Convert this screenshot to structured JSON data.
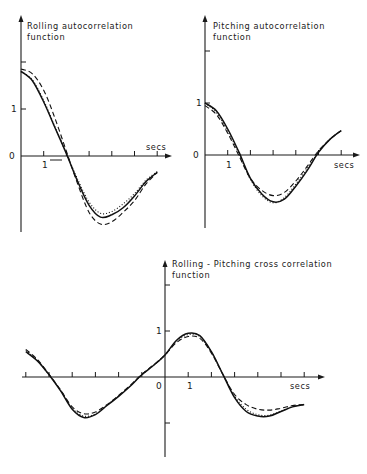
{
  "chart_data": [
    {
      "id": "rolling",
      "type": "line",
      "title": "Rolling autocorrelation function",
      "title_lines": [
        "Rolling  autocorrelation",
        "function"
      ],
      "xlabel": "secs",
      "ylabel": "",
      "x_tick_labels": [
        {
          "x": 1,
          "label": "1"
        }
      ],
      "y_tick_labels": [
        {
          "y": 0,
          "label": "0"
        },
        {
          "y": 1,
          "label": "1"
        }
      ],
      "x_ticks": [
        1,
        2,
        3,
        4,
        5,
        6
      ],
      "y_ticks": [
        1,
        2
      ],
      "xlim": [
        0,
        6.6
      ],
      "ylim": [
        -2.1,
        3.0
      ],
      "grid": false,
      "legend": null,
      "series": [
        {
          "name": "solid",
          "style": "solid",
          "x": [
            0,
            0.5,
            1.0,
            1.5,
            2.0,
            2.5,
            3.0,
            3.5,
            4.0,
            4.5,
            5.0,
            5.5,
            6.0
          ],
          "y": [
            1.8,
            1.6,
            1.15,
            0.6,
            0.05,
            -0.55,
            -1.05,
            -1.3,
            -1.25,
            -1.1,
            -0.85,
            -0.55,
            -0.35
          ]
        },
        {
          "name": "dashed",
          "style": "dashed",
          "x": [
            0,
            0.5,
            1.0,
            1.5,
            2.0,
            2.5,
            3.0,
            3.5,
            4.0,
            4.5,
            5.0,
            5.5,
            6.0
          ],
          "y": [
            1.85,
            1.75,
            1.4,
            0.8,
            0.1,
            -0.6,
            -1.2,
            -1.45,
            -1.4,
            -1.2,
            -0.95,
            -0.6,
            -0.35
          ]
        },
        {
          "name": "dotted",
          "style": "dotted",
          "x": [
            0,
            0.5,
            1.0,
            1.5,
            2.0,
            2.5,
            3.0,
            3.5,
            4.0,
            4.5,
            5.0,
            5.5,
            6.0
          ],
          "y": [
            1.8,
            1.62,
            1.18,
            0.62,
            0.05,
            -0.5,
            -0.98,
            -1.22,
            -1.18,
            -1.02,
            -0.8,
            -0.52,
            -0.33
          ]
        }
      ]
    },
    {
      "id": "pitching",
      "type": "line",
      "title": "Pitching autocorrelation function",
      "title_lines": [
        "Pitching  autocorrelation",
        "function"
      ],
      "xlabel": "secs",
      "ylabel": "",
      "x_tick_labels": [
        {
          "x": 1,
          "label": "1"
        }
      ],
      "y_tick_labels": [
        {
          "y": 0,
          "label": "0"
        },
        {
          "y": 1,
          "label": "1"
        }
      ],
      "x_ticks": [
        1,
        2,
        3,
        4,
        5,
        6
      ],
      "y_ticks": [
        1,
        2
      ],
      "xlim": [
        0,
        6.8
      ],
      "ylim": [
        -1.4,
        3.0
      ],
      "grid": false,
      "legend": null,
      "series": [
        {
          "name": "solid",
          "style": "solid",
          "x": [
            0,
            0.5,
            1.0,
            1.5,
            2.0,
            2.5,
            3.0,
            3.5,
            4.0,
            4.5,
            5.0,
            5.5,
            6.0
          ],
          "y": [
            1.0,
            0.85,
            0.5,
            0.05,
            -0.45,
            -0.75,
            -0.9,
            -0.85,
            -0.6,
            -0.3,
            0.05,
            0.3,
            0.47
          ]
        },
        {
          "name": "dashed",
          "style": "dashed",
          "x": [
            0,
            0.5,
            1.0,
            1.5,
            2.0,
            2.5,
            3.0,
            3.5,
            4.0,
            4.5,
            5.0,
            5.5,
            6.0
          ],
          "y": [
            0.95,
            0.78,
            0.42,
            -0.02,
            -0.45,
            -0.68,
            -0.78,
            -0.72,
            -0.5,
            -0.22,
            0.08,
            0.3,
            0.47
          ]
        },
        {
          "name": "dotted",
          "style": "dotted",
          "x": [
            0,
            0.5,
            1.0,
            1.5,
            2.0,
            2.5,
            3.0,
            3.5,
            4.0,
            4.5,
            5.0,
            5.5,
            6.0
          ],
          "y": [
            1.0,
            0.82,
            0.46,
            0.02,
            -0.47,
            -0.78,
            -0.92,
            -0.82,
            -0.56,
            -0.26,
            0.06,
            0.3,
            0.47
          ]
        }
      ]
    },
    {
      "id": "cross",
      "type": "line",
      "title": "Rolling-Pitching cross correlation function",
      "title_lines": [
        "Rolling - Pitching  cross  correlation",
        "function"
      ],
      "xlabel": "secs",
      "ylabel": "",
      "x_tick_labels": [
        {
          "x": 0,
          "label": "0"
        },
        {
          "x": 1,
          "label": "1"
        }
      ],
      "y_tick_labels": [
        {
          "y": 1,
          "label": "1"
        }
      ],
      "x_ticks": [
        -6,
        -5,
        -4,
        -3,
        -2,
        -1,
        1,
        2,
        3,
        4,
        5,
        6
      ],
      "y_ticks": [
        -1,
        1,
        2
      ],
      "xlim": [
        -6.4,
        7.0
      ],
      "ylim": [
        -1.7,
        3.0
      ],
      "grid": false,
      "legend": null,
      "series": [
        {
          "name": "solid",
          "style": "solid",
          "x": [
            -6,
            -5.5,
            -5,
            -4.5,
            -4,
            -3.5,
            -3,
            -2.5,
            -2,
            -1.5,
            -1,
            -0.5,
            0,
            0.5,
            1,
            1.5,
            2,
            2.5,
            3,
            3.5,
            4,
            4.5,
            5,
            5.5,
            6
          ],
          "y": [
            0.55,
            0.35,
            0.05,
            -0.3,
            -0.7,
            -0.88,
            -0.82,
            -0.62,
            -0.42,
            -0.2,
            0.05,
            0.25,
            0.48,
            0.8,
            0.95,
            0.9,
            0.55,
            0.05,
            -0.45,
            -0.75,
            -0.85,
            -0.85,
            -0.75,
            -0.65,
            -0.6
          ]
        },
        {
          "name": "dashed",
          "style": "dashed",
          "x": [
            -6,
            -5.5,
            -5,
            -4.5,
            -4,
            -3.5,
            -3,
            -2.5,
            -2,
            -1.5,
            -1,
            -0.5,
            0,
            0.5,
            1,
            1.5,
            2,
            2.5,
            3,
            3.5,
            4,
            4.5,
            5,
            5.5,
            6
          ],
          "y": [
            0.6,
            0.38,
            0.06,
            -0.28,
            -0.65,
            -0.8,
            -0.76,
            -0.6,
            -0.4,
            -0.18,
            0.06,
            0.26,
            0.48,
            0.75,
            0.88,
            0.84,
            0.52,
            0.05,
            -0.38,
            -0.6,
            -0.7,
            -0.72,
            -0.68,
            -0.62,
            -0.6
          ]
        },
        {
          "name": "dotted",
          "style": "dotted",
          "x": [
            -6,
            -5.5,
            -5,
            -4.5,
            -4,
            -3.5,
            -3,
            -2.5,
            -2,
            -1.5,
            -1,
            -0.5,
            0,
            0.5,
            1,
            1.5,
            2,
            2.5,
            3,
            3.5,
            4,
            4.5,
            5,
            5.5,
            6
          ],
          "y": [
            0.58,
            0.36,
            0.05,
            -0.29,
            -0.68,
            -0.85,
            -0.8,
            -0.61,
            -0.41,
            -0.19,
            0.05,
            0.25,
            0.48,
            0.78,
            0.92,
            0.88,
            0.54,
            0.05,
            -0.42,
            -0.7,
            -0.82,
            -0.83,
            -0.74,
            -0.64,
            -0.6
          ]
        }
      ]
    }
  ],
  "layout": {
    "rolling": {
      "ox": 21,
      "oy": 156,
      "sx": 22.7,
      "sy": 47,
      "x_end": 172,
      "y_top": 15,
      "y_bottom": 232,
      "x_start": 21
    },
    "pitching": {
      "ox": 205,
      "oy": 155,
      "sx": 22.7,
      "sy": 52,
      "x_end": 360,
      "y_top": 15,
      "y_bottom": 228,
      "x_start": 205
    },
    "cross": {
      "ox": 165,
      "oy": 377,
      "sx": 23.2,
      "sy": 46,
      "x_end": 325,
      "y_top": 260,
      "y_bottom": 457,
      "x_start": 22
    }
  }
}
